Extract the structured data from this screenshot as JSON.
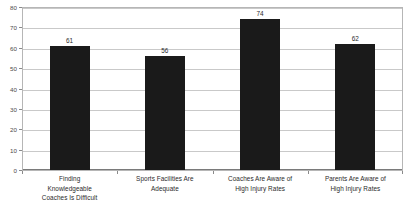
{
  "chart_data": {
    "type": "bar",
    "title": "",
    "subtitle": "",
    "xlabel": "",
    "ylabel": "",
    "ylim": [
      0,
      80
    ],
    "ytick_step": 10,
    "yticks": [
      0,
      10,
      20,
      30,
      40,
      50,
      60,
      70,
      80
    ],
    "ytick_labels": [
      "0",
      "10",
      "20",
      "30",
      "40",
      "50",
      "60",
      "70",
      "80"
    ],
    "grid": true,
    "grid_axis": "y",
    "legend": false,
    "legend_position": "none",
    "bar_color": "#1a1a1a",
    "plot_border_color": "#b6b6b6",
    "gridline_color": "#c9c9c9",
    "background_color": "#ffffff",
    "data_labels": true,
    "categories": [
      "Finding Knowledgeable Coaches Is Difficult",
      "Sports Facilities Are Adequate",
      "Coaches Are Aware of High Injury Rates",
      "Parents Are Aware of High Injury Rates"
    ],
    "category_lines": [
      [
        "Finding",
        "Knowledgeable",
        "Coaches Is Difficult"
      ],
      [
        "Sports Facilities Are",
        "Adequate"
      ],
      [
        "Coaches Are Aware of",
        "High Injury Rates"
      ],
      [
        "Parents Are Aware of",
        "High Injury Rates"
      ]
    ],
    "values": [
      61,
      56,
      74,
      62
    ],
    "value_labels": [
      "61",
      "56",
      "74",
      "62"
    ]
  }
}
